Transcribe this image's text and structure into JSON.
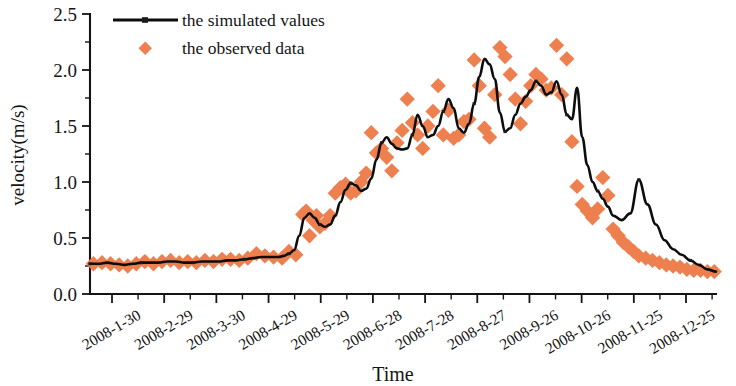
{
  "chart_data": {
    "type": "line",
    "title": "",
    "subtitle": "",
    "xlabel": "Time",
    "ylabel": "velocity(m/s)",
    "ylim": [
      0.0,
      2.5
    ],
    "ytick_labels": [
      "0.0",
      "0.5",
      "1.0",
      "1.5",
      "2.0",
      "2.5"
    ],
    "ytick_values": [
      0.0,
      0.5,
      1.0,
      1.5,
      2.0,
      2.5
    ],
    "yminor_count_between": 1,
    "grid": false,
    "legend_position": "top-left",
    "xtick_labels": [
      "2008-1-30",
      "2008-2-29",
      "2008-3-30",
      "2008-4-29",
      "2008-5-29",
      "2008-6-28",
      "2008-7-28",
      "2008-8-27",
      "2008-9-26",
      "2008-10-26",
      "2008-11-25",
      "2008-12-25"
    ],
    "xtick_rotation_deg": -30,
    "xlim_index": [
      0,
      365
    ],
    "series": [
      {
        "name": "the simulated values",
        "marker": "line",
        "color": "#0d0d0d",
        "x": [
          0,
          5,
          10,
          15,
          20,
          25,
          30,
          35,
          40,
          45,
          50,
          55,
          60,
          65,
          70,
          75,
          80,
          85,
          90,
          95,
          100,
          105,
          110,
          113,
          116,
          119,
          122,
          125,
          128,
          131,
          134,
          137,
          140,
          143,
          146,
          149,
          152,
          155,
          158,
          161,
          164,
          167,
          170,
          173,
          176,
          179,
          182,
          185,
          188,
          191,
          194,
          197,
          200,
          203,
          206,
          209,
          212,
          215,
          218,
          221,
          224,
          227,
          230,
          233,
          236,
          239,
          242,
          245,
          248,
          251,
          254,
          257,
          260,
          263,
          266,
          269,
          272,
          275,
          278,
          281,
          284,
          287,
          290,
          293,
          296,
          299,
          302,
          305,
          310,
          315,
          320,
          325,
          330,
          335,
          340,
          345,
          350,
          355,
          360,
          365
        ],
        "values": [
          0.27,
          0.27,
          0.28,
          0.27,
          0.26,
          0.27,
          0.28,
          0.28,
          0.28,
          0.29,
          0.29,
          0.28,
          0.28,
          0.29,
          0.29,
          0.29,
          0.3,
          0.3,
          0.31,
          0.32,
          0.33,
          0.33,
          0.33,
          0.34,
          0.36,
          0.39,
          0.52,
          0.68,
          0.72,
          0.68,
          0.62,
          0.6,
          0.62,
          0.7,
          0.82,
          0.93,
          0.99,
          0.97,
          0.92,
          0.94,
          1.03,
          1.2,
          1.35,
          1.4,
          1.34,
          1.3,
          1.29,
          1.3,
          1.42,
          1.6,
          1.5,
          1.4,
          1.42,
          1.5,
          1.63,
          1.74,
          1.66,
          1.48,
          1.44,
          1.52,
          1.7,
          1.94,
          2.1,
          2.05,
          1.92,
          1.62,
          1.45,
          1.48,
          1.6,
          1.7,
          1.76,
          1.82,
          1.9,
          1.86,
          1.78,
          1.8,
          1.9,
          1.78,
          1.6,
          1.56,
          1.84,
          1.4,
          1.15,
          1.0,
          0.92,
          0.85,
          0.78,
          0.7,
          0.66,
          0.72,
          1.02,
          0.8,
          0.62,
          0.48,
          0.4,
          0.35,
          0.3,
          0.26,
          0.22,
          0.2
        ]
      },
      {
        "name": "the observed data",
        "marker": "diamond",
        "color": "#ee7f4e",
        "x": [
          2,
          7,
          12,
          17,
          22,
          27,
          32,
          37,
          42,
          47,
          52,
          57,
          62,
          67,
          72,
          77,
          82,
          87,
          92,
          97,
          102,
          107,
          112,
          116,
          120,
          124,
          126,
          128,
          130,
          132,
          134,
          137,
          140,
          143,
          146,
          149,
          152,
          155,
          158,
          161,
          164,
          167,
          170,
          173,
          176,
          179,
          182,
          185,
          188,
          191,
          194,
          197,
          200,
          203,
          206,
          209,
          212,
          215,
          218,
          221,
          224,
          227,
          230,
          233,
          236,
          239,
          242,
          245,
          248,
          251,
          254,
          257,
          260,
          263,
          266,
          269,
          272,
          275,
          278,
          281,
          284,
          287,
          290,
          293,
          296,
          299,
          302,
          305,
          308,
          311,
          314,
          317,
          320,
          324,
          328,
          332,
          336,
          340,
          344,
          348,
          352,
          356,
          360,
          364
        ],
        "values": [
          0.27,
          0.28,
          0.27,
          0.26,
          0.25,
          0.27,
          0.29,
          0.27,
          0.29,
          0.3,
          0.28,
          0.29,
          0.28,
          0.3,
          0.29,
          0.31,
          0.31,
          0.3,
          0.32,
          0.36,
          0.34,
          0.33,
          0.32,
          0.38,
          0.35,
          0.71,
          0.74,
          0.52,
          0.66,
          0.7,
          0.6,
          0.63,
          0.7,
          0.9,
          0.95,
          0.98,
          0.9,
          0.92,
          1.0,
          1.08,
          1.44,
          1.26,
          1.3,
          1.22,
          1.1,
          1.35,
          1.46,
          1.74,
          1.53,
          1.42,
          1.3,
          1.5,
          1.63,
          1.86,
          1.42,
          1.64,
          1.39,
          1.42,
          1.54,
          1.56,
          2.09,
          1.86,
          1.48,
          1.4,
          1.78,
          2.2,
          2.12,
          1.96,
          1.74,
          1.52,
          1.72,
          1.86,
          1.96,
          1.92,
          1.82,
          1.84,
          2.22,
          1.78,
          2.1,
          1.36,
          0.96,
          0.8,
          0.74,
          0.68,
          0.76,
          1.04,
          0.88,
          0.58,
          0.52,
          0.46,
          0.42,
          0.38,
          0.34,
          0.32,
          0.3,
          0.28,
          0.26,
          0.25,
          0.24,
          0.22,
          0.21,
          0.21,
          0.2,
          0.2
        ]
      }
    ]
  },
  "legend": {
    "items": [
      {
        "label": "the simulated values",
        "style": "line",
        "color": "#0d0d0d"
      },
      {
        "label": "the observed data",
        "style": "diamond",
        "color": "#ee7f4e"
      }
    ]
  },
  "colors": {
    "observed": "#ee7f4e",
    "simulated": "#0d0d0d",
    "axis": "#141414",
    "background": "#ffffff"
  }
}
